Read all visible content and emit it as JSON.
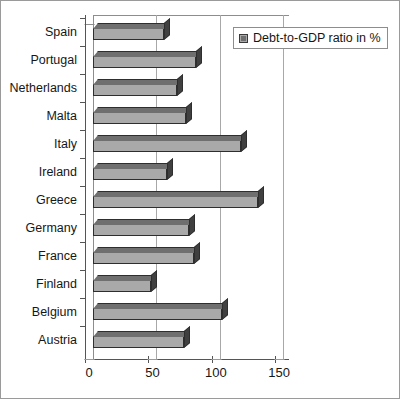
{
  "chart_data": {
    "type": "bar",
    "orientation": "horizontal",
    "title": "",
    "xlabel": "",
    "ylabel": "",
    "xlim": [
      0,
      155
    ],
    "xticks": [
      0,
      50,
      100,
      150
    ],
    "grid": true,
    "legend_position": "top-right",
    "legend_entries": [
      "Debt-to-GDP ratio in %"
    ],
    "series_name": "Debt-to-GDP ratio in %",
    "bar_color": "#a9a9a9",
    "bar_top_color": "#6f6f6f",
    "bar_side_color": "#404040",
    "categories": [
      "Spain",
      "Portugal",
      "Netherlands",
      "Malta",
      "Italy",
      "Ireland",
      "Greece",
      "Germany",
      "France",
      "Finland",
      "Belgium",
      "Austria"
    ],
    "values": [
      56,
      81,
      66,
      73,
      117,
      58,
      130,
      76,
      80,
      46,
      102,
      72
    ]
  },
  "axis": {
    "tick_labels": [
      "0",
      "50",
      "100",
      "150"
    ]
  },
  "legend": {
    "label": "Debt-to-GDP ratio in %"
  }
}
